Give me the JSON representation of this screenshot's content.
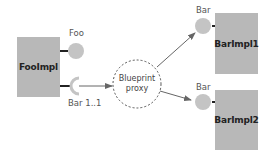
{
  "diagram": {
    "components": [
      {
        "id": "fooimpl",
        "label": "FooImpl"
      },
      {
        "id": "barimpl1",
        "label": "BarImpl1"
      },
      {
        "id": "barimpl2",
        "label": "BarImpl2"
      }
    ],
    "proxy": {
      "line1": "Blueprint",
      "line2": "proxy"
    },
    "interfaces": {
      "foo_service": {
        "label": "Foo",
        "kind": "provided"
      },
      "bar_reference": {
        "label": "Bar 1..1",
        "kind": "required"
      },
      "bar_service_1": {
        "label": "Bar",
        "kind": "provided"
      },
      "bar_service_2": {
        "label": "Bar",
        "kind": "provided"
      }
    },
    "connections": [
      {
        "from": "bar_reference",
        "to": "proxy"
      },
      {
        "from": "proxy",
        "to": "bar_service_1"
      },
      {
        "from": "proxy",
        "to": "bar_service_2"
      }
    ],
    "colors": {
      "box_fill": "#b8b8b8",
      "interface_fill": "#c4c4c4",
      "connector": "#222222",
      "arrow": "#666666",
      "proxy_border": "#555555"
    }
  }
}
